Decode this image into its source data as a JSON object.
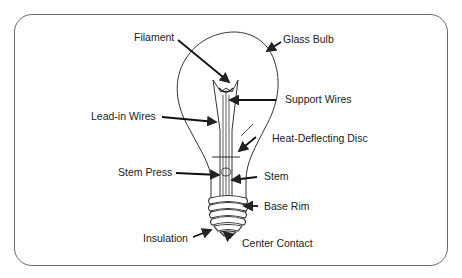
{
  "diagram": {
    "labels": [
      {
        "id": "filament",
        "text": "Filament"
      },
      {
        "id": "glass-bulb",
        "text": "Glass Bulb"
      },
      {
        "id": "support-wires",
        "text": "Support Wires"
      },
      {
        "id": "lead-in-wires",
        "text": "Lead-in Wires"
      },
      {
        "id": "heat-deflecting-disc",
        "text": "Heat-Deflecting Disc"
      },
      {
        "id": "stem-press",
        "text": "Stem Press"
      },
      {
        "id": "stem",
        "text": "Stem"
      },
      {
        "id": "base-rim",
        "text": "Base Rim"
      },
      {
        "id": "insulation",
        "text": "Insulation"
      },
      {
        "id": "center-contact",
        "text": "Center Contact"
      }
    ],
    "colors": {
      "line": "#222222",
      "frame": "#6a6a6a",
      "text": "#222222",
      "background": "#ffffff"
    }
  }
}
